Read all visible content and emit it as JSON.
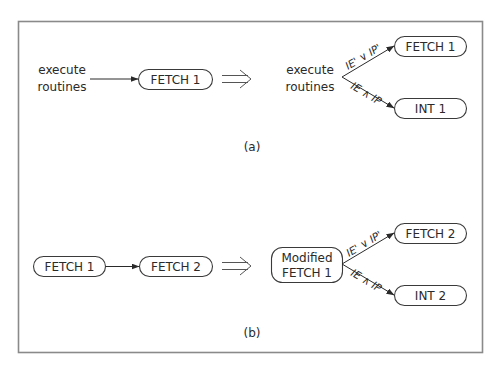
{
  "figure": {
    "panels": [
      {
        "caption": "(a)",
        "before": {
          "source_label_lines": [
            "execute",
            "routines"
          ],
          "target": "FETCH 1"
        },
        "after": {
          "source_label_lines": [
            "execute",
            "routines"
          ],
          "branches": [
            {
              "condition": "IE' ∨ IP'",
              "target": "FETCH 1"
            },
            {
              "condition": "IE ∧ IP",
              "target": "INT 1"
            }
          ]
        }
      },
      {
        "caption": "(b)",
        "before": {
          "source": "FETCH 1",
          "target": "FETCH 2"
        },
        "after": {
          "source_lines": [
            "Modified",
            "FETCH 1"
          ],
          "branches": [
            {
              "condition": "IE' ∨ IP'",
              "target": "FETCH 2"
            },
            {
              "condition": "IE ∧ IP",
              "target": "INT 2"
            }
          ]
        }
      }
    ],
    "icons": {
      "transform_arrow": "double-line-implies-arrow",
      "edge_arrow": "filled-arrowhead"
    },
    "colors": {
      "frame": "#8a8a8a",
      "stroke": "#3a3a3a",
      "text": "#2a2a2a",
      "background": "#ffffff"
    }
  }
}
